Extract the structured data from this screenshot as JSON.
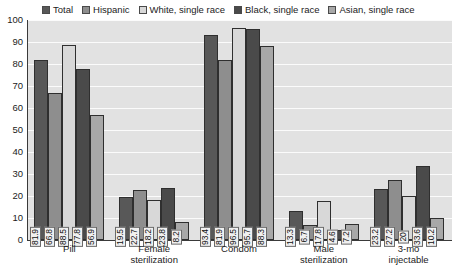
{
  "chart_data": {
    "type": "bar",
    "title": "",
    "subtitle": "",
    "xlabel": "",
    "ylabel": "",
    "ylim": [
      0,
      100
    ],
    "y_ticks": [
      0,
      10,
      20,
      30,
      40,
      50,
      60,
      70,
      80,
      90,
      100
    ],
    "grid": true,
    "legend_position": "top",
    "categories": [
      "Pill",
      "Female sterilization",
      "Condom",
      "Male sterilization",
      "3-mo injectable"
    ],
    "category_lines": [
      [
        "Pill"
      ],
      [
        "Female",
        "sterilization"
      ],
      [
        "Condom"
      ],
      [
        "Male",
        "sterilization"
      ],
      [
        "3-mo",
        "injectable"
      ]
    ],
    "series": [
      {
        "name": "Total",
        "color": "#585858",
        "values": [
          81.9,
          19.5,
          93.4,
          13.3,
          23.2
        ],
        "labels": [
          "81.9",
          "19.5",
          "93.4",
          "13.3",
          "23.2"
        ]
      },
      {
        "name": "Hispanic",
        "color": "#8e8e8e",
        "values": [
          66.8,
          22.7,
          81.9,
          6.7,
          27.2
        ],
        "labels": [
          "66.8",
          "22.7",
          "81.9",
          "6.7",
          "27.2"
        ]
      },
      {
        "name": "White, single race",
        "color": "#d8d8d8",
        "values": [
          88.5,
          18.2,
          96.5,
          17.8,
          20.0
        ],
        "labels": [
          "88.5",
          "18.2",
          "96.5",
          "17.8",
          "20"
        ]
      },
      {
        "name": "Black, single race",
        "color": "#4a4a4a",
        "values": [
          77.8,
          23.8,
          95.7,
          4.6,
          33.6
        ],
        "labels": [
          "77.8",
          "23.8",
          "95.7",
          "4.6",
          "33.6"
        ]
      },
      {
        "name": "Asian, single race",
        "color": "#a8a8a8",
        "values": [
          56.9,
          8.2,
          88.3,
          7.2,
          10.2
        ],
        "labels": [
          "56.9",
          "8.2",
          "88.3",
          "7.2",
          "10.2"
        ]
      }
    ]
  },
  "legend": {
    "entries": [
      {
        "label": "Total",
        "color": "#585858"
      },
      {
        "label": "Hispanic",
        "color": "#8e8e8e"
      },
      {
        "label": "White, single race",
        "color": "#d8d8d8"
      },
      {
        "label": "Black, single race",
        "color": "#4a4a4a"
      },
      {
        "label": "Asian, single race",
        "color": "#a8a8a8"
      }
    ]
  },
  "y_axis": {
    "labels": [
      "100",
      "90",
      "80",
      "70",
      "60",
      "50",
      "40",
      "30",
      "20",
      "10",
      "0"
    ]
  },
  "colors": {
    "plot_background": "#e2e2e2",
    "gridline": "#fbfbfb",
    "axis": "#3a3a3a",
    "text": "#1b1b1b",
    "bar_border": "#2f2f2f",
    "label_box_fill": "#f0f0f0",
    "label_box_border": "#6a6a6a"
  }
}
